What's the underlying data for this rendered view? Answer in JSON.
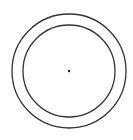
{
  "diagram": {
    "type": "concentric-circles",
    "center": {
      "x": 69,
      "y": 71
    },
    "outer_circle": {
      "radius": 57,
      "stroke": "#333333",
      "stroke_width": 1.3
    },
    "inner_circle": {
      "radius": 46,
      "stroke": "#333333",
      "stroke_width": 1.3
    },
    "center_point": {
      "radius": 1.2,
      "fill": "#222222"
    },
    "background": "#ffffff"
  }
}
